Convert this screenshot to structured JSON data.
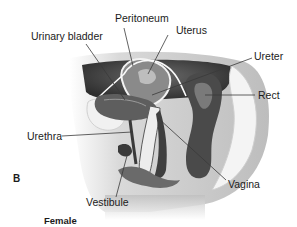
{
  "figure": {
    "panel_letter": "B",
    "caption": "Female",
    "labels": [
      {
        "id": "peritoneum",
        "text": "Peritoneum"
      },
      {
        "id": "uterus",
        "text": "Uterus"
      },
      {
        "id": "urinary_bladder",
        "text": "Urinary bladder"
      },
      {
        "id": "ureter",
        "text": "Ureter"
      },
      {
        "id": "rectum",
        "text": "Rect"
      },
      {
        "id": "urethra",
        "text": "Urethra"
      },
      {
        "id": "vagina",
        "text": "Vagina"
      },
      {
        "id": "vestibule",
        "text": "Vestibule"
      }
    ]
  },
  "colors": {
    "line": "#3a3a3a",
    "tissue_light": "#e6e6e6",
    "tissue_mid": "#9a9a9a",
    "tissue_dark": "#3c3c3c"
  }
}
